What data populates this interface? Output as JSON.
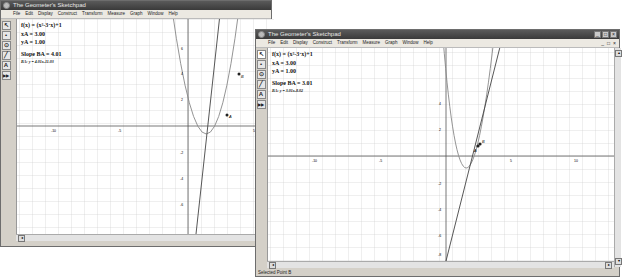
{
  "window1": {
    "title": "The Geometer's Sketchpad",
    "title_buttons": [
      "_",
      "□",
      "×"
    ],
    "menu": [
      "File",
      "Edit",
      "Display",
      "Construct",
      "Transform",
      "Measure",
      "Graph",
      "Window",
      "Help"
    ],
    "mdi_buttons": [
      "_",
      "□",
      "×"
    ],
    "tools": [
      "arrow-tool",
      "point-tool",
      "compass-tool",
      "straightedge-tool",
      "text-tool",
      "custom-tool"
    ],
    "tool_glyphs": [
      "↖",
      "•",
      "⊙",
      "╱",
      "A",
      "▶▶"
    ],
    "measurements": {
      "function": "f(x) = (x²-3·x)+1",
      "xA": "xA = 3.00",
      "yA": "yA = 1.00",
      "slope": "Slope BA = 4.01",
      "line_eq": "BA: y = 4.01x-11.03"
    },
    "axis_labels": {
      "x_neg10": "-10",
      "x_neg5": "-5",
      "x_5": "5",
      "y_2": "2",
      "y_4": "4",
      "y_6": "6",
      "y_neg2": "-2",
      "y_neg4": "-4",
      "y_neg6": "-6"
    },
    "point_labels": {
      "A": "A",
      "B": "B"
    }
  },
  "window2": {
    "title": "The Geometer's Sketchpad",
    "title_buttons": [
      "_",
      "□",
      "×"
    ],
    "menu": [
      "File",
      "Edit",
      "Display",
      "Construct",
      "Transform",
      "Measure",
      "Graph",
      "Window",
      "Help"
    ],
    "mdi_buttons": [
      "_",
      "□",
      "×"
    ],
    "tools": [
      "arrow-tool",
      "point-tool",
      "compass-tool",
      "straightedge-tool",
      "text-tool",
      "custom-tool"
    ],
    "tool_glyphs": [
      "↖",
      "•",
      "⊙",
      "╱",
      "A",
      "▶▶"
    ],
    "measurements": {
      "function": "f(x) = (x²-3·x)+1",
      "xA": "xA = 3.00",
      "yA": "yA = 1.00",
      "slope": "Slope BA = 3.01",
      "line_eq": "BA: y = 3.01x-8.02"
    },
    "axis_labels": {
      "x_neg10": "-10",
      "x_neg5": "-5",
      "x_5": "5",
      "x_10": "10",
      "y_2": "2",
      "y_4": "4",
      "y_neg2": "-2",
      "y_neg4": "-4",
      "y_neg6": "-6",
      "y_neg8": "-8"
    },
    "point_labels": {
      "A": "A",
      "B": "B"
    },
    "status": "Selected Point B"
  }
}
